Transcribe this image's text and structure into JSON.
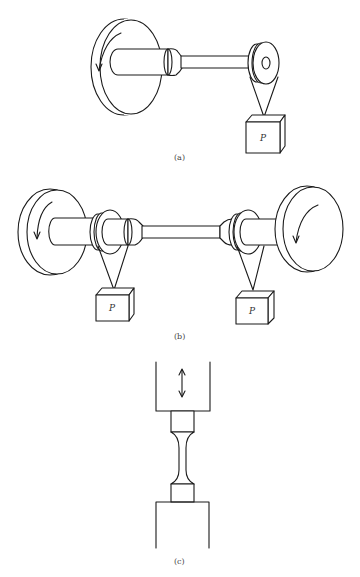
{
  "figure": {
    "panels": [
      {
        "id": "a",
        "caption": "(a)",
        "description": "Rotating cantilever beam: flywheel drives specimen with single load P hung from bearing at free end",
        "load_label": "P"
      },
      {
        "id": "b",
        "caption": "(b)",
        "description": "Four-point rotating beam: specimen between two flywheels with two loads P hung from bearings",
        "load_labels": [
          "P",
          "P"
        ]
      },
      {
        "id": "c",
        "caption": "(c)",
        "description": "Axial loading: dog-bone specimen gripped between upper and lower grips with reversing arrow"
      }
    ],
    "colors": {
      "line": "#1a1a1a",
      "background": "#ffffff"
    }
  }
}
